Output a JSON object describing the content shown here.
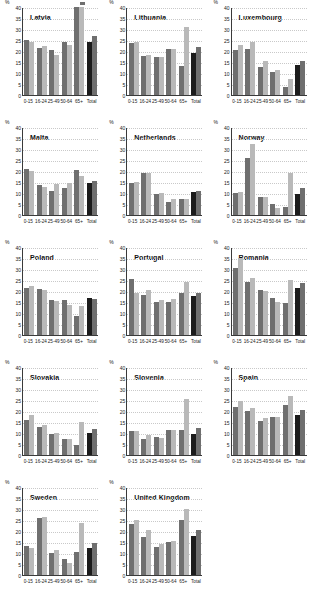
{
  "axis": {
    "unit_label": "%",
    "y_ticks": [
      0,
      5,
      10,
      15,
      20,
      25,
      30,
      35,
      40
    ],
    "y_min": 0,
    "y_max": 40,
    "categories": [
      "0-15",
      "16-24",
      "25-49",
      "50-64",
      "65+",
      "Total"
    ]
  },
  "colors": {
    "series_a": "#6f6f6f",
    "series_b": "#b9b9b9",
    "total_a": "#1c1c1c",
    "total_b": "#6f6f6f",
    "axis": "#3a3a3a",
    "gridline": "#c9c9c9"
  },
  "chart_data": [
    {
      "type": "bar",
      "title": "Latvia",
      "xlabel": "",
      "ylabel": "%",
      "ylim": [
        0,
        40
      ],
      "grid": true,
      "categories": [
        "0-15",
        "16-24",
        "25-49",
        "50-64",
        "65+",
        "Total"
      ],
      "series": [
        {
          "name": "series_a",
          "values": [
            25.0,
            21.5,
            20.3,
            24.2,
            41.0,
            24.2
          ]
        },
        {
          "name": "series_b",
          "values": [
            24.3,
            22.3,
            18.2,
            22.6,
            42.5,
            26.8
          ]
        }
      ],
      "clipped_bar": {
        "category": "65+",
        "series": "series_b"
      }
    },
    {
      "type": "bar",
      "title": "Lithuania",
      "xlabel": "",
      "ylabel": "%",
      "ylim": [
        0,
        40
      ],
      "grid": true,
      "categories": [
        "0-15",
        "16-24",
        "25-49",
        "50-64",
        "65+",
        "Total"
      ],
      "series": [
        {
          "name": "series_a",
          "values": [
            23.8,
            17.6,
            17.5,
            20.8,
            13.0,
            19.0
          ]
        },
        {
          "name": "series_b",
          "values": [
            24.0,
            18.4,
            17.3,
            20.8,
            30.8,
            22.0
          ]
        }
      ]
    },
    {
      "type": "bar",
      "title": "Luxembourg",
      "xlabel": "",
      "ylabel": "%",
      "ylim": [
        0,
        40
      ],
      "grid": true,
      "categories": [
        "0-15",
        "16-24",
        "25-49",
        "50-64",
        "65+",
        "Total"
      ],
      "series": [
        {
          "name": "series_a",
          "values": [
            20.5,
            20.8,
            12.8,
            10.4,
            3.5,
            13.5
          ]
        },
        {
          "name": "series_b",
          "values": [
            22.6,
            24.3,
            15.4,
            11.3,
            7.3,
            15.6
          ]
        }
      ]
    },
    {
      "type": "bar",
      "title": "Malta",
      "xlabel": "",
      "ylabel": "%",
      "ylim": [
        0,
        40
      ],
      "grid": true,
      "categories": [
        "0-15",
        "16-24",
        "25-49",
        "50-64",
        "65+",
        "Total"
      ],
      "series": [
        {
          "name": "series_a",
          "values": [
            20.8,
            13.8,
            11.1,
            12.4,
            20.3,
            14.7
          ]
        },
        {
          "name": "series_b",
          "values": [
            19.9,
            12.6,
            14.1,
            14.4,
            17.7,
            15.5
          ]
        }
      ]
    },
    {
      "type": "bar",
      "title": "Netherlands",
      "xlabel": "",
      "ylabel": "%",
      "ylim": [
        0,
        40
      ],
      "grid": true,
      "categories": [
        "0-15",
        "16-24",
        "25-49",
        "50-64",
        "65+",
        "Total"
      ],
      "series": [
        {
          "name": "series_a",
          "values": [
            14.7,
            18.9,
            9.4,
            6.0,
            7.4,
            10.5
          ]
        },
        {
          "name": "series_b",
          "values": [
            15.2,
            18.9,
            10.1,
            7.4,
            7.4,
            11.0
          ]
        }
      ]
    },
    {
      "type": "bar",
      "title": "Norway",
      "xlabel": "",
      "ylabel": "%",
      "ylim": [
        0,
        40
      ],
      "grid": true,
      "categories": [
        "0-15",
        "16-24",
        "25-49",
        "50-64",
        "65+",
        "Total"
      ],
      "series": [
        {
          "name": "series_a",
          "values": [
            10.1,
            26.0,
            8.4,
            5.2,
            3.7,
            9.4
          ]
        },
        {
          "name": "series_b",
          "values": [
            10.4,
            32.3,
            8.0,
            3.0,
            19.0,
            12.2
          ]
        }
      ]
    },
    {
      "type": "bar",
      "title": "Poland",
      "xlabel": "",
      "ylabel": "%",
      "ylim": [
        0,
        40
      ],
      "grid": true,
      "categories": [
        "0-15",
        "16-24",
        "25-49",
        "50-64",
        "65+",
        "Total"
      ],
      "series": [
        {
          "name": "series_a",
          "values": [
            21.2,
            20.7,
            15.8,
            16.0,
            8.7,
            17.0
          ]
        },
        {
          "name": "series_b",
          "values": [
            22.3,
            20.6,
            15.4,
            13.5,
            13.0,
            16.5
          ]
        }
      ]
    },
    {
      "type": "bar",
      "title": "Portugal",
      "xlabel": "",
      "ylabel": "%",
      "ylim": [
        0,
        40
      ],
      "grid": true,
      "categories": [
        "0-15",
        "16-24",
        "25-49",
        "50-64",
        "65+",
        "Total"
      ],
      "series": [
        {
          "name": "series_a",
          "values": [
            25.3,
            18.3,
            15.0,
            14.8,
            19.0,
            17.7
          ]
        },
        {
          "name": "series_b",
          "values": [
            19.2,
            20.6,
            16.1,
            16.5,
            24.2,
            19.0
          ]
        }
      ]
    },
    {
      "type": "bar",
      "title": "Romania",
      "xlabel": "",
      "ylabel": "%",
      "ylim": [
        0,
        40
      ],
      "grid": true,
      "categories": [
        "0-15",
        "16-24",
        "25-49",
        "50-64",
        "65+",
        "Total"
      ],
      "series": [
        {
          "name": "series_a",
          "values": [
            30.5,
            23.9,
            20.4,
            16.7,
            14.7,
            21.3
          ]
        },
        {
          "name": "series_b",
          "values": [
            34.9,
            25.9,
            20.2,
            15.0,
            25.2,
            23.6
          ]
        }
      ]
    },
    {
      "type": "bar",
      "title": "Slovakia",
      "xlabel": "",
      "ylabel": "%",
      "ylim": [
        0,
        40
      ],
      "grid": true,
      "categories": [
        "0-15",
        "16-24",
        "25-49",
        "50-64",
        "65+",
        "Total"
      ],
      "series": [
        {
          "name": "series_a",
          "values": [
            15.7,
            12.6,
            9.6,
            7.3,
            4.4,
            10.1
          ]
        },
        {
          "name": "series_b",
          "values": [
            18.0,
            13.6,
            9.8,
            7.3,
            14.8,
            11.7
          ]
        }
      ]
    },
    {
      "type": "bar",
      "title": "Slovenia",
      "xlabel": "",
      "ylabel": "%",
      "ylim": [
        0,
        40
      ],
      "grid": true,
      "categories": [
        "0-15",
        "16-24",
        "25-49",
        "50-64",
        "65+",
        "Total"
      ],
      "series": [
        {
          "name": "series_a",
          "values": [
            10.8,
            7.2,
            8.2,
            11.5,
            11.4,
            9.6
          ]
        },
        {
          "name": "series_b",
          "values": [
            11.1,
            9.1,
            7.9,
            11.5,
            25.5,
            12.5
          ]
        }
      ]
    },
    {
      "type": "bar",
      "title": "Spain",
      "xlabel": "",
      "ylabel": "%",
      "ylim": [
        0,
        40
      ],
      "grid": true,
      "categories": [
        "0-15",
        "16-24",
        "25-49",
        "50-64",
        "65+",
        "Total"
      ],
      "series": [
        {
          "name": "series_a",
          "values": [
            21.9,
            20.2,
            15.3,
            17.1,
            22.6,
            18.1
          ]
        },
        {
          "name": "series_b",
          "values": [
            24.4,
            21.3,
            16.7,
            17.1,
            26.8,
            20.5
          ]
        }
      ]
    },
    {
      "type": "bar",
      "title": "Sweden",
      "xlabel": "",
      "ylabel": "%",
      "ylim": [
        0,
        40
      ],
      "grid": true,
      "categories": [
        "0-15",
        "16-24",
        "25-49",
        "50-64",
        "65+",
        "Total"
      ],
      "series": [
        {
          "name": "series_a",
          "values": [
            13.0,
            25.8,
            9.9,
            7.1,
            10.5,
            12.1
          ]
        },
        {
          "name": "series_b",
          "values": [
            12.5,
            26.5,
            11.3,
            5.6,
            23.6,
            14.5
          ]
        }
      ]
    },
    {
      "type": "bar",
      "title": "United Kingdom",
      "xlabel": "",
      "ylabel": "%",
      "ylim": [
        0,
        40
      ],
      "grid": true,
      "categories": [
        "0-15",
        "16-24",
        "25-49",
        "50-64",
        "65+",
        "Total"
      ],
      "series": [
        {
          "name": "series_a",
          "values": [
            23.3,
            17.1,
            12.7,
            15.0,
            24.9,
            17.6
          ]
        },
        {
          "name": "series_b",
          "values": [
            25.1,
            20.5,
            14.3,
            15.5,
            30.0,
            20.3
          ]
        }
      ]
    }
  ]
}
